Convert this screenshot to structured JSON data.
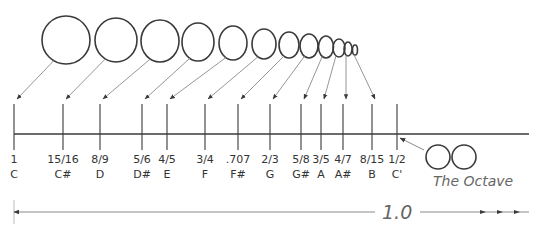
{
  "diagram": {
    "colors": {
      "stroke": "#3a3a3a",
      "light_line": "#8a8a8a",
      "text": "#333333",
      "script_text": "#666666",
      "background": "#ffffff"
    },
    "notes": [
      {
        "ratio": "1",
        "note": "C",
        "x": 14,
        "circle": {
          "cx": 66,
          "cy": 40,
          "rx": 24,
          "ry": 24
        }
      },
      {
        "ratio": "15/16",
        "note": "C#",
        "x": 63,
        "circle": {
          "cx": 116,
          "cy": 40,
          "rx": 21,
          "ry": 22
        }
      },
      {
        "ratio": "8/9",
        "note": "D",
        "x": 100,
        "circle": {
          "cx": 160,
          "cy": 41,
          "rx": 19,
          "ry": 21
        }
      },
      {
        "ratio": "5/6",
        "note": "D#",
        "x": 142,
        "circle": {
          "cx": 198,
          "cy": 42,
          "rx": 16,
          "ry": 19
        }
      },
      {
        "ratio": "4/5",
        "note": "E",
        "x": 167,
        "circle": {
          "cx": 233,
          "cy": 43,
          "rx": 14,
          "ry": 17
        }
      },
      {
        "ratio": "3/4",
        "note": "F",
        "x": 205,
        "circle": {
          "cx": 264,
          "cy": 44,
          "rx": 12,
          "ry": 15
        }
      },
      {
        "ratio": ".707",
        "note": "F#",
        "x": 238,
        "circle": {
          "cx": 289,
          "cy": 45,
          "rx": 10,
          "ry": 13
        }
      },
      {
        "ratio": "2/3",
        "note": "G",
        "x": 270,
        "circle": {
          "cx": 309,
          "cy": 46,
          "rx": 9,
          "ry": 12
        }
      },
      {
        "ratio": "5/8",
        "note": "G#",
        "x": 301,
        "circle": {
          "cx": 326,
          "cy": 47,
          "rx": 7.5,
          "ry": 11
        }
      },
      {
        "ratio": "3/5",
        "note": "A",
        "x": 321,
        "circle": {
          "cx": 339,
          "cy": 48,
          "rx": 6,
          "ry": 9
        }
      },
      {
        "ratio": "4/7",
        "note": "A#",
        "x": 343,
        "circle": {
          "cx": 348,
          "cy": 49,
          "rx": 4,
          "ry": 7
        }
      },
      {
        "ratio": "8/15",
        "note": "B",
        "x": 372,
        "circle": {
          "cx": 355,
          "cy": 50,
          "rx": 2.5,
          "ry": 5
        }
      },
      {
        "ratio": "1/2",
        "note": "C'",
        "x": 397,
        "circle": null
      }
    ],
    "octave": {
      "label": "The Octave",
      "circles": [
        {
          "cx": 438,
          "cy": 157,
          "r": 12
        },
        {
          "cx": 464,
          "cy": 157,
          "r": 12
        }
      ]
    },
    "span_label": "1.0",
    "axis": {
      "y": 134,
      "x_start": 14,
      "x_end": 529
    }
  }
}
